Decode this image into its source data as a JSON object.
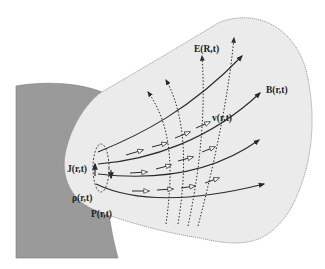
{
  "diagram": {
    "type": "physics-field-schematic",
    "colors": {
      "background": "#ffffff",
      "body_fill": "#ebebeb",
      "body_outline": "#8a8a8a",
      "dark_body_fill": "#9a9a9a",
      "line": "#2a2a2a",
      "text": "#222222"
    },
    "labels": {
      "electric_field": "E(R,t)",
      "magnetic_field": "B(r,t)",
      "velocity": "v(r,t)",
      "current_density": "J(r,t)",
      "charge_density": "ρ(r,t)",
      "pressure": "P(r,t)"
    },
    "elements": {
      "magnetic_field_lines": {
        "count": 4,
        "style": "solid",
        "arrowheads": "filled"
      },
      "electric_field_lines": {
        "count": 4,
        "style": "dotted",
        "arrowheads": "filled"
      },
      "velocity_vectors": {
        "count": 10,
        "style": "short-arrows",
        "arrowheads": "open"
      },
      "source_loop": {
        "style": "dashed-ellipse"
      }
    }
  }
}
